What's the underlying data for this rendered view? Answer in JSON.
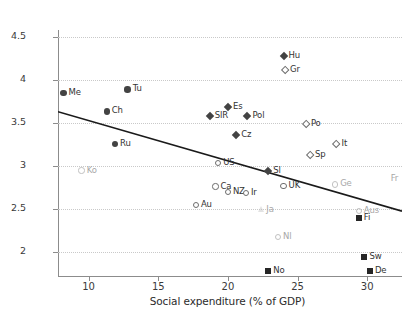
{
  "chart_data": {
    "type": "scatter",
    "title": "",
    "xlabel": "Social expenditure (% of GDP)",
    "ylabel": "% population finding it difficult to live on income (log scale)",
    "xlim": [
      7.8,
      32.5
    ],
    "ylim": [
      1.72,
      4.65
    ],
    "xticks": [
      10,
      15,
      20,
      25,
      30
    ],
    "yticks": [
      2,
      2.5,
      3,
      3.5,
      4,
      4.5
    ],
    "grid": true,
    "legend": "none",
    "trendline": {
      "x0": 7.8,
      "y0": 3.63,
      "x1": 32.5,
      "y1": 2.475
    },
    "points": [
      {
        "label": "Me",
        "x": 8.2,
        "y": 3.845,
        "marker": "circle-filled",
        "labelpos": "right"
      },
      {
        "label": "Ko",
        "x": 9.5,
        "y": 2.945,
        "marker": "circle-open",
        "labelpos": "right",
        "faint": true
      },
      {
        "label": "Ch",
        "x": 11.3,
        "y": 3.635,
        "marker": "circle-filled",
        "labelpos": "right"
      },
      {
        "label": "Ru",
        "x": 11.9,
        "y": 3.255,
        "marker": "circle-filled",
        "labelpos": "right"
      },
      {
        "label": "Tu",
        "x": 12.8,
        "y": 3.89,
        "marker": "circle-filled",
        "labelpos": "right"
      },
      {
        "label": "Au",
        "x": 17.7,
        "y": 2.545,
        "marker": "circle-open",
        "labelpos": "right"
      },
      {
        "label": "SlR",
        "x": 18.7,
        "y": 3.58,
        "marker": "diamond-filled",
        "labelpos": "right"
      },
      {
        "label": "Ca",
        "x": 19.1,
        "y": 2.76,
        "marker": "circle-open",
        "labelpos": "right"
      },
      {
        "label": "US",
        "x": 19.3,
        "y": 3.035,
        "marker": "circle-open",
        "labelpos": "right"
      },
      {
        "label": "NZ",
        "x": 20.0,
        "y": 2.695,
        "marker": "circle-open",
        "labelpos": "right"
      },
      {
        "label": "Es",
        "x": 20.0,
        "y": 3.68,
        "marker": "diamond-filled",
        "labelpos": "right"
      },
      {
        "label": "Cz",
        "x": 20.6,
        "y": 3.355,
        "marker": "diamond-filled",
        "labelpos": "right"
      },
      {
        "label": "Pol",
        "x": 21.4,
        "y": 3.575,
        "marker": "diamond-filled",
        "labelpos": "right"
      },
      {
        "label": "Ir",
        "x": 21.3,
        "y": 2.685,
        "marker": "circle-open",
        "labelpos": "right"
      },
      {
        "label": "Ja",
        "x": 22.4,
        "y": 2.49,
        "marker": "triangle-open",
        "labelpos": "right",
        "faint": true
      },
      {
        "label": "Sl",
        "x": 22.9,
        "y": 2.945,
        "marker": "diamond-filled",
        "labelpos": "right"
      },
      {
        "label": "No",
        "x": 22.9,
        "y": 1.775,
        "marker": "square-filled",
        "labelpos": "right"
      },
      {
        "label": "Nl",
        "x": 23.6,
        "y": 2.175,
        "marker": "circle-open",
        "labelpos": "right",
        "faint": true
      },
      {
        "label": "Hu",
        "x": 24.0,
        "y": 4.275,
        "marker": "diamond-filled",
        "labelpos": "right"
      },
      {
        "label": "UK",
        "x": 24.0,
        "y": 2.765,
        "marker": "circle-open",
        "labelpos": "right"
      },
      {
        "label": "Gr",
        "x": 24.1,
        "y": 4.115,
        "marker": "diamond-open",
        "labelpos": "right"
      },
      {
        "label": "Po",
        "x": 25.6,
        "y": 3.49,
        "marker": "diamond-open",
        "labelpos": "right"
      },
      {
        "label": "Sp",
        "x": 25.9,
        "y": 3.125,
        "marker": "diamond-open",
        "labelpos": "right"
      },
      {
        "label": "Ge",
        "x": 27.7,
        "y": 2.785,
        "marker": "circle-open",
        "labelpos": "right",
        "faint": true
      },
      {
        "label": "It",
        "x": 27.8,
        "y": 3.25,
        "marker": "diamond-open",
        "labelpos": "right"
      },
      {
        "label": "Fi",
        "x": 29.4,
        "y": 2.39,
        "marker": "square-filled",
        "labelpos": "right"
      },
      {
        "label": "Aus",
        "x": 29.4,
        "y": 2.475,
        "marker": "circle-open",
        "labelpos": "right",
        "faint": true
      },
      {
        "label": "Sw",
        "x": 29.8,
        "y": 1.945,
        "marker": "square-filled",
        "labelpos": "right"
      },
      {
        "label": "De",
        "x": 30.2,
        "y": 1.775,
        "marker": "square-filled",
        "labelpos": "right"
      },
      {
        "label": "Fr",
        "x": 31.9,
        "y": 2.85,
        "marker": "none",
        "labelpos": "noMarker",
        "faint": true
      }
    ]
  },
  "colors": {
    "axis": "#8c8c8c",
    "grid": "#c9c9c9",
    "marker_dark": "#434343",
    "marker_black": "#262626",
    "text": "#2b2b2b",
    "faint": "#a8a8a8",
    "trendline": "#1a1a1a"
  }
}
